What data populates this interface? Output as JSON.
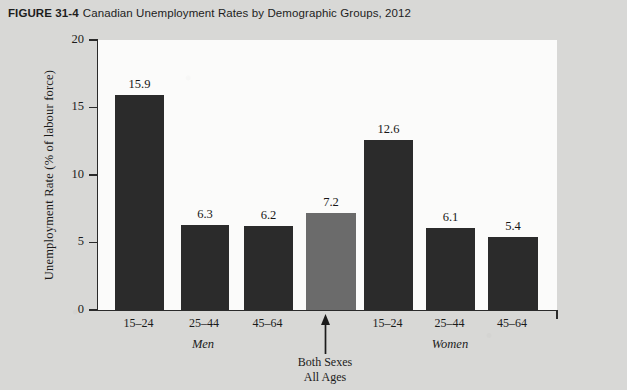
{
  "figure": {
    "number": "FIGURE 31-4",
    "title": "Canadian Unemployment Rates by Demographic Groups, 2012"
  },
  "chart_data": {
    "type": "bar",
    "title": "Canadian Unemployment Rates by Demographic Groups, 2012",
    "xlabel": "",
    "ylabel": "Unemployment Rate (% of labour force)",
    "ylim": [
      0,
      20
    ],
    "yticks": [
      0,
      5,
      10,
      15,
      20
    ],
    "ytick_labels": [
      "0",
      "5",
      "10",
      "15",
      "20"
    ],
    "grid": false,
    "legend": "none",
    "categories": [
      "15–24",
      "25–44",
      "45–64",
      "All Ages",
      "15–24",
      "25–44",
      "45–64"
    ],
    "values": [
      15.9,
      6.3,
      6.2,
      7.2,
      12.6,
      6.1,
      5.4
    ],
    "value_labels": [
      "15.9",
      "6.3",
      "6.2",
      "7.2",
      "12.6",
      "6.1",
      "5.4"
    ],
    "bars": [
      {
        "category": "15–24",
        "value": 15.9,
        "label": "15.9",
        "group": "Men",
        "color": "#2b2b2b"
      },
      {
        "category": "25–44",
        "value": 6.3,
        "label": "6.3",
        "group": "Men",
        "color": "#2b2b2b"
      },
      {
        "category": "45–64",
        "value": 6.2,
        "label": "6.2",
        "group": "Men",
        "color": "#2b2b2b"
      },
      {
        "category": "All Ages",
        "value": 7.2,
        "label": "7.2",
        "group": "Both Sexes",
        "color": "#6b6b6b"
      },
      {
        "category": "15–24",
        "value": 12.6,
        "label": "12.6",
        "group": "Women",
        "color": "#2b2b2b"
      },
      {
        "category": "25–44",
        "value": 6.1,
        "label": "6.1",
        "group": "Women",
        "color": "#2b2b2b"
      },
      {
        "category": "45–64",
        "value": 5.4,
        "label": "5.4",
        "group": "Women",
        "color": "#2b2b2b"
      }
    ],
    "groups": [
      {
        "name": "Men",
        "label": "Men"
      },
      {
        "name": "Women",
        "label": "Women"
      }
    ],
    "annotations": [
      {
        "name": "both-sexes-all-ages",
        "line1": "Both Sexes",
        "line2": "All Ages",
        "marker": "up-arrow"
      }
    ],
    "colors": {
      "bar_dark": "#2b2b2b",
      "bar_highlight": "#6b6b6b",
      "axis": "#2a2a2a",
      "plot_background": "#fbfbfa",
      "page_background": "#d8d8d6"
    }
  }
}
